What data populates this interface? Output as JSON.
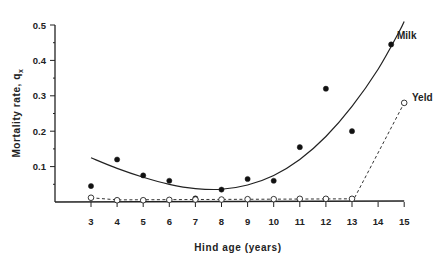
{
  "chart_data": {
    "type": "scatter",
    "title": "",
    "xlabel": "Hind age (years)",
    "ylabel": "Mortality rate, q",
    "ylabel_subscript": "x",
    "xlim": [
      2,
      15
    ],
    "ylim": [
      0,
      0.5
    ],
    "x_ticks": [
      3,
      4,
      5,
      6,
      7,
      8,
      9,
      10,
      11,
      12,
      13,
      14,
      15
    ],
    "y_ticks": [
      0.1,
      0.2,
      0.3,
      0.4,
      0.5
    ],
    "y_tick_labels": [
      "0.1",
      "0.2",
      "0.3",
      "0.4",
      "0.5"
    ],
    "grid": false,
    "legend": "inline labels at curve ends",
    "series": [
      {
        "name": "Milk",
        "marker": "filled-circle",
        "points": [
          {
            "x": 3,
            "y": 0.045
          },
          {
            "x": 4,
            "y": 0.12
          },
          {
            "x": 5,
            "y": 0.075
          },
          {
            "x": 6,
            "y": 0.06
          },
          {
            "x": 7,
            "y": 0.01
          },
          {
            "x": 8,
            "y": 0.035
          },
          {
            "x": 9,
            "y": 0.065
          },
          {
            "x": 10,
            "y": 0.06
          },
          {
            "x": 11,
            "y": 0.155
          },
          {
            "x": 12,
            "y": 0.32
          },
          {
            "x": 13,
            "y": 0.2
          },
          {
            "x": 14.5,
            "y": 0.445
          }
        ],
        "fit_line": {
          "style": "solid",
          "points": [
            {
              "x": 3,
              "y": 0.125
            },
            {
              "x": 4,
              "y": 0.095
            },
            {
              "x": 5,
              "y": 0.07
            },
            {
              "x": 6,
              "y": 0.05
            },
            {
              "x": 7,
              "y": 0.038
            },
            {
              "x": 8,
              "y": 0.036
            },
            {
              "x": 9,
              "y": 0.048
            },
            {
              "x": 10,
              "y": 0.075
            },
            {
              "x": 11,
              "y": 0.12
            },
            {
              "x": 12,
              "y": 0.185
            },
            {
              "x": 13,
              "y": 0.27
            },
            {
              "x": 14,
              "y": 0.375
            },
            {
              "x": 14.8,
              "y": 0.48
            },
            {
              "x": 15,
              "y": 0.51
            }
          ]
        }
      },
      {
        "name": "Yeld",
        "marker": "open-circle",
        "points": [
          {
            "x": 3,
            "y": 0.012
          },
          {
            "x": 4,
            "y": 0.005
          },
          {
            "x": 5,
            "y": 0.005
          },
          {
            "x": 6,
            "y": 0.006
          },
          {
            "x": 7,
            "y": 0.007
          },
          {
            "x": 8,
            "y": 0.007
          },
          {
            "x": 9,
            "y": 0.008
          },
          {
            "x": 10,
            "y": 0.008
          },
          {
            "x": 11,
            "y": 0.009
          },
          {
            "x": 12,
            "y": 0.009
          },
          {
            "x": 13,
            "y": 0.009
          },
          {
            "x": 15,
            "y": 0.28
          }
        ],
        "fit_line": {
          "style": "dashed",
          "points": [
            {
              "x": 3,
              "y": 0.012
            },
            {
              "x": 4,
              "y": 0.006
            },
            {
              "x": 13,
              "y": 0.009
            },
            {
              "x": 13.1,
              "y": 0.012
            },
            {
              "x": 15,
              "y": 0.28
            }
          ]
        }
      }
    ],
    "annotations": [
      {
        "text": "Milk",
        "x": 14.6,
        "y": 0.47
      },
      {
        "text": "Yeld",
        "x": 15.2,
        "y": 0.31
      }
    ]
  },
  "labels": {
    "xlabel": "Hind age (years)",
    "ylabel_main": "Mortality rate, q",
    "ylabel_sub": "x",
    "milk": "Milk",
    "yeld": "Yeld"
  }
}
